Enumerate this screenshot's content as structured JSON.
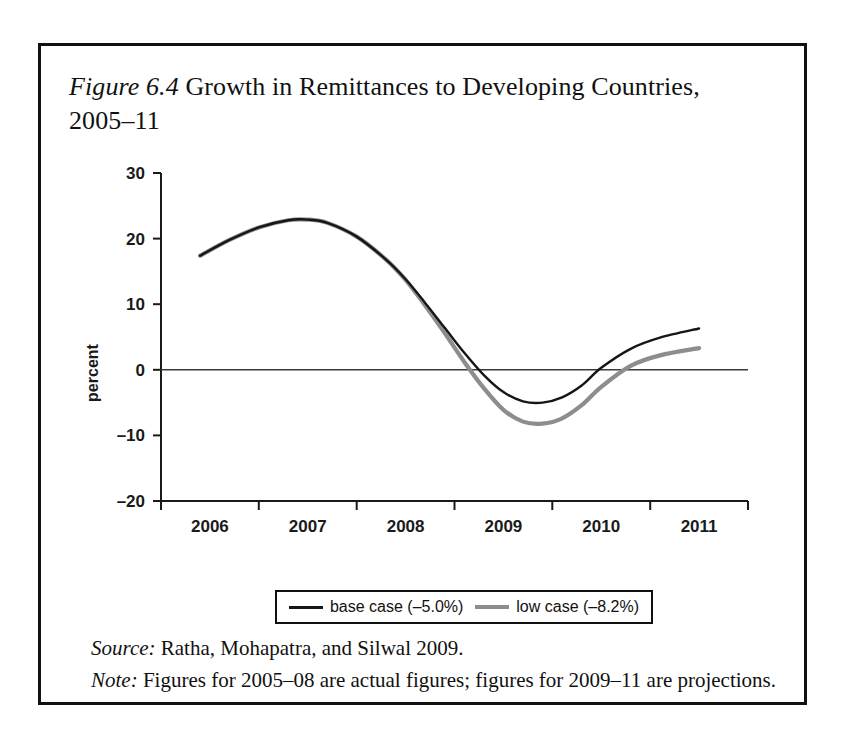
{
  "figure": {
    "label": "Figure 6.4",
    "title_rest": " Growth in Remittances to Developing Countries, 2005–11"
  },
  "legend": {
    "base": {
      "label": "base case (–5.0%)",
      "color": "#161616"
    },
    "low": {
      "label": "low case (–8.2%)",
      "color": "#8d8d8d"
    }
  },
  "footnotes": {
    "source_lead": "Source:",
    "source_text": " Ratha, Mohapatra, and Silwal 2009.",
    "note_lead": "Note:",
    "note_text": " Figures for 2005–08 are actual figures; figures for 2009–11 are projections."
  },
  "chart_data": {
    "type": "line",
    "title": "Figure 6.4 Growth in Remittances to Developing Countries, 2005–11",
    "xlabel": "",
    "ylabel": "percent",
    "xlim": [
      2005.5,
      2011.5
    ],
    "ylim": [
      -20,
      30
    ],
    "yticks": [
      30,
      20,
      10,
      0,
      -10,
      -20
    ],
    "ytick_labels": [
      "30",
      "20",
      "10",
      "0",
      "–10",
      "–20"
    ],
    "xticks": [
      2006,
      2007,
      2008,
      2009,
      2010,
      2011
    ],
    "xtick_labels": [
      "2006",
      "2007",
      "2008",
      "2009",
      "2010",
      "2011"
    ],
    "grid": false,
    "zero_line": true,
    "legend_position": "below-axes",
    "x": [
      2005.9,
      2006.2,
      2006.5,
      2006.8,
      2007.0,
      2007.2,
      2007.5,
      2007.8,
      2008.0,
      2008.2,
      2008.4,
      2008.6,
      2008.8,
      2009.0,
      2009.2,
      2009.4,
      2009.6,
      2009.8,
      2010.0,
      2010.3,
      2010.6,
      2011.0
    ],
    "series": [
      {
        "name": "base case (–5.0%)",
        "color": "#161616",
        "values": [
          17.4,
          19.8,
          21.7,
          22.8,
          22.9,
          22.4,
          20.3,
          16.8,
          13.8,
          10.2,
          6.4,
          2.6,
          -0.8,
          -3.4,
          -4.8,
          -5.0,
          -4.2,
          -2.4,
          0.3,
          3.2,
          4.9,
          6.3
        ]
      },
      {
        "name": "low case (–8.2%)",
        "color": "#8d8d8d",
        "values": [
          17.4,
          19.8,
          21.7,
          22.8,
          22.9,
          22.4,
          20.3,
          16.8,
          13.7,
          9.8,
          5.6,
          1.2,
          -2.8,
          -6.1,
          -7.9,
          -8.2,
          -7.4,
          -5.4,
          -2.6,
          0.6,
          2.2,
          3.3
        ]
      }
    ],
    "annotations": [
      "Both series coincide from 2006 through early 2008, then diverge.",
      "Base case trough about -5.0 percent in 2009; low case trough about -8.2 percent in 2009."
    ]
  }
}
